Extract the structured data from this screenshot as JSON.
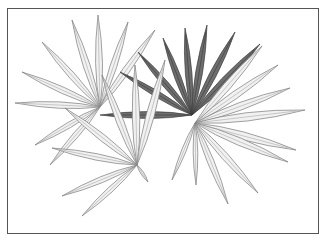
{
  "artwork": {
    "subject": "Pencil drawing of palm fronds",
    "caption": "",
    "colors": {
      "background": "#ffffff",
      "frame": "#555555",
      "light_leaf_fill": "#f1f1f1",
      "light_leaf_stroke": "#7a7a7a",
      "dark_leaf_fill": "#6e6e6e",
      "dark_leaf_stroke": "#3c3c3c",
      "mid_leaf_fill": "#a8a8a8"
    },
    "fronds": [
      {
        "name": "left-frond",
        "tone": "light",
        "center": [
          100,
          107
        ],
        "tips": [
          [
            22,
            72
          ],
          [
            42,
            42
          ],
          [
            72,
            20
          ],
          [
            98,
            15
          ],
          [
            128,
            22
          ],
          [
            155,
            30
          ],
          [
            15,
            103
          ],
          [
            35,
            145
          ],
          [
            50,
            165
          ]
        ]
      },
      {
        "name": "dark-back-frond",
        "tone": "dark",
        "center": [
          192,
          115
        ],
        "tips": [
          [
            138,
            52
          ],
          [
            163,
            38
          ],
          [
            185,
            28
          ],
          [
            207,
            25
          ],
          [
            235,
            32
          ],
          [
            260,
            44
          ],
          [
            120,
            72
          ],
          [
            100,
            115
          ]
        ]
      },
      {
        "name": "bottom-frond",
        "tone": "light",
        "center": [
          137,
          165
        ],
        "tips": [
          [
            52,
            148
          ],
          [
            65,
            108
          ],
          [
            102,
            75
          ],
          [
            135,
            65
          ],
          [
            165,
            60
          ],
          [
            62,
            196
          ],
          [
            82,
            216
          ],
          [
            148,
            182
          ]
        ]
      },
      {
        "name": "right-frond",
        "tone": "light",
        "center": [
          195,
          123
        ],
        "tips": [
          [
            262,
            46
          ],
          [
            278,
            65
          ],
          [
            290,
            88
          ],
          [
            305,
            110
          ],
          [
            296,
            150
          ],
          [
            288,
            162
          ],
          [
            258,
            193
          ],
          [
            228,
            204
          ],
          [
            196,
            185
          ],
          [
            172,
            180
          ]
        ]
      }
    ]
  }
}
